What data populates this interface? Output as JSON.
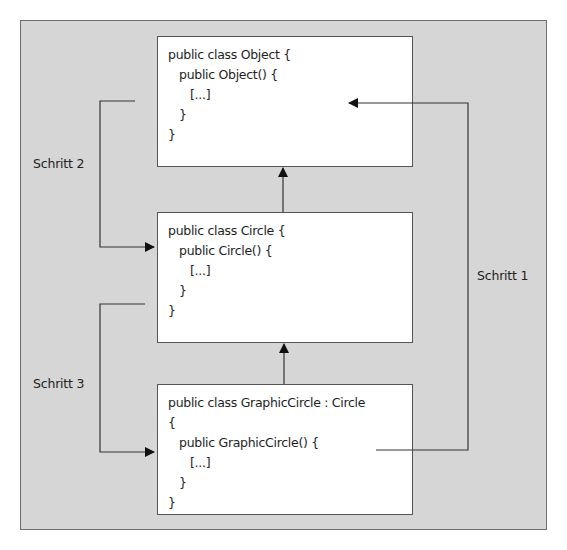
{
  "diagram": {
    "boxes": [
      {
        "id": "object",
        "lines": [
          "public class Object {",
          "   public Object() {",
          "      [...]",
          "   }",
          "}"
        ]
      },
      {
        "id": "circle",
        "lines": [
          "public class Circle {",
          "   public Circle() {",
          "      [...]",
          "   }",
          "}"
        ]
      },
      {
        "id": "graphic_circle",
        "lines": [
          "public class GraphicCircle : Circle",
          "{",
          "   public GraphicCircle() {",
          "      [...]",
          "   }",
          "}"
        ]
      }
    ],
    "steps": {
      "step1": "Schritt 1",
      "step2": "Schritt 2",
      "step3": "Schritt 3"
    },
    "colors": {
      "frame": "#d6d6d6",
      "box": "#ffffff",
      "line": "#333333"
    }
  }
}
